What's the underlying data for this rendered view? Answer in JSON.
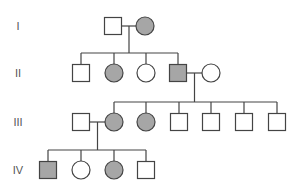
{
  "diagram": {
    "type": "pedigree",
    "colors": {
      "affected_fill": "#a6a6a6",
      "unaffected_fill": "#ffffff",
      "stroke": "#444444"
    },
    "generations": [
      {
        "label": "I",
        "y": 26
      },
      {
        "label": "II",
        "y": 73
      },
      {
        "label": "III",
        "y": 122
      },
      {
        "label": "IV",
        "y": 170
      }
    ],
    "individuals": [
      {
        "id": "I-1",
        "gen": 0,
        "x": 113,
        "sex": "male",
        "affected": false
      },
      {
        "id": "I-2",
        "gen": 0,
        "x": 145,
        "sex": "female",
        "affected": true
      },
      {
        "id": "II-1",
        "gen": 1,
        "x": 81,
        "sex": "male",
        "affected": false
      },
      {
        "id": "II-2",
        "gen": 1,
        "x": 114,
        "sex": "female",
        "affected": true
      },
      {
        "id": "II-3",
        "gen": 1,
        "x": 146,
        "sex": "female",
        "affected": false
      },
      {
        "id": "II-4",
        "gen": 1,
        "x": 178,
        "sex": "male",
        "affected": true
      },
      {
        "id": "II-5",
        "gen": 1,
        "x": 211,
        "sex": "female",
        "affected": false
      },
      {
        "id": "III-1",
        "gen": 2,
        "x": 81,
        "sex": "male",
        "affected": false
      },
      {
        "id": "III-2",
        "gen": 2,
        "x": 114,
        "sex": "female",
        "affected": true
      },
      {
        "id": "III-3",
        "gen": 2,
        "x": 146,
        "sex": "female",
        "affected": true
      },
      {
        "id": "III-4",
        "gen": 2,
        "x": 179,
        "sex": "male",
        "affected": false
      },
      {
        "id": "III-5",
        "gen": 2,
        "x": 211,
        "sex": "male",
        "affected": false
      },
      {
        "id": "III-6",
        "gen": 2,
        "x": 244,
        "sex": "male",
        "affected": false
      },
      {
        "id": "III-7",
        "gen": 2,
        "x": 277,
        "sex": "male",
        "affected": false
      },
      {
        "id": "IV-1",
        "gen": 3,
        "x": 48,
        "sex": "male",
        "affected": true
      },
      {
        "id": "IV-2",
        "gen": 3,
        "x": 81,
        "sex": "female",
        "affected": false
      },
      {
        "id": "IV-3",
        "gen": 3,
        "x": 114,
        "sex": "female",
        "affected": true
      },
      {
        "id": "IV-4",
        "gen": 3,
        "x": 146,
        "sex": "male",
        "affected": false
      }
    ],
    "matings": [
      {
        "partners": [
          "I-1",
          "I-2"
        ],
        "children": [
          "II-1",
          "II-2",
          "II-3",
          "II-4"
        ]
      },
      {
        "partners": [
          "II-4",
          "II-5"
        ],
        "children": [
          "III-2",
          "III-3",
          "III-4",
          "III-5",
          "III-6",
          "III-7"
        ]
      },
      {
        "partners": [
          "III-1",
          "III-2"
        ],
        "children": [
          "IV-1",
          "IV-2",
          "IV-3",
          "IV-4"
        ]
      }
    ]
  }
}
